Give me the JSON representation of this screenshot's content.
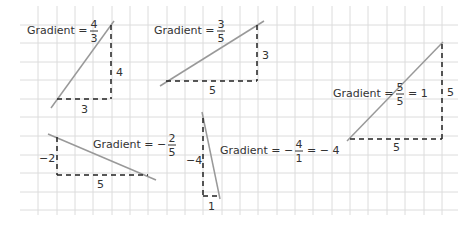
{
  "grid": {
    "x_start": 20,
    "x_end": 458,
    "y_start": 6,
    "y_end": 215,
    "v_lines": [
      38,
      57,
      75,
      93,
      112,
      130,
      148,
      167,
      185,
      203,
      222,
      240,
      258,
      277,
      295,
      313,
      332,
      350,
      368,
      387,
      405,
      424,
      442
    ],
    "h_lines": [
      25,
      43,
      62,
      80,
      99,
      117,
      136,
      155,
      173,
      192,
      210
    ],
    "color": "#dcdcdc"
  },
  "colors": {
    "line": "#999999",
    "dash": "#222222",
    "text": "#333333"
  },
  "triangles": [
    {
      "id": "gradient-4-3",
      "line": [
        51,
        108,
        114,
        21
      ],
      "rise": {
        "x": 111,
        "y1": 25,
        "y2": 99,
        "label": "4",
        "lx": 116,
        "ly": 76
      },
      "run": {
        "y": 99,
        "x1": 57,
        "x2": 111,
        "label": "3",
        "lx": 81,
        "ly": 113
      },
      "caption": {
        "prefix": "Gradient =",
        "sign": "",
        "num": "4",
        "den": "3",
        "suffix": "",
        "x": 27,
        "y": 34
      }
    },
    {
      "id": "gradient-3-5",
      "line": [
        160,
        86,
        264,
        21
      ],
      "rise": {
        "x": 257,
        "y1": 25,
        "y2": 81,
        "label": "3",
        "lx": 262,
        "ly": 59
      },
      "run": {
        "y": 81,
        "x1": 166,
        "x2": 257,
        "label": "5",
        "lx": 209,
        "ly": 94
      },
      "caption": {
        "prefix": "Gradient =",
        "sign": "",
        "num": "3",
        "den": "5",
        "suffix": "",
        "x": 154,
        "y": 34
      }
    },
    {
      "id": "gradient-5-5",
      "line": [
        347,
        141,
        443,
        42
      ],
      "rise": {
        "x": 442,
        "y1": 44,
        "y2": 139,
        "label": "5",
        "lx": 447,
        "ly": 96
      },
      "run": {
        "y": 139,
        "x1": 350,
        "x2": 442,
        "label": "5",
        "lx": 393,
        "ly": 151
      },
      "caption": {
        "prefix": "Gradient =",
        "sign": "",
        "num": "5",
        "den": "5",
        "suffix": "= 1",
        "x": 333,
        "y": 97
      }
    },
    {
      "id": "gradient-neg-2-5",
      "line": [
        48,
        134,
        156,
        180
      ],
      "rise": {
        "x": 57,
        "y1": 137,
        "y2": 175,
        "label": "−2",
        "lx": 39,
        "ly": 162
      },
      "run": {
        "y": 175,
        "x1": 57,
        "x2": 148,
        "label": "5",
        "lx": 97,
        "ly": 188
      },
      "caption": {
        "prefix": "Gradient =",
        "sign": "−",
        "num": "2",
        "den": "5",
        "suffix": "",
        "x": 93,
        "y": 148
      }
    },
    {
      "id": "gradient-neg-4",
      "line": [
        202,
        112,
        220,
        199
      ],
      "rise": {
        "x": 203,
        "y1": 118,
        "y2": 196,
        "label": "−4",
        "lx": 186,
        "ly": 164
      },
      "run": {
        "y": 196,
        "x1": 203,
        "x2": 218,
        "label": "1",
        "lx": 208,
        "ly": 210
      },
      "caption": {
        "prefix": "Gradient =",
        "sign": "−",
        "num": "4",
        "den": "1",
        "suffix": "= − 4",
        "x": 220,
        "y": 154
      }
    }
  ]
}
